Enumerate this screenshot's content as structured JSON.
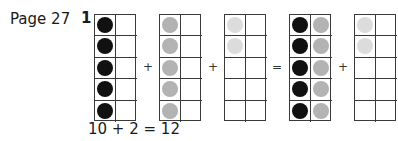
{
  "page_label": "Page 27",
  "question_number": "1",
  "colors": {
    "black": "#111111",
    "grey": "#b3b3b3",
    "light": "#dcdcdc"
  },
  "frames": [
    {
      "left": 94,
      "cells": [
        "black",
        "",
        "black",
        "",
        "black",
        "",
        "black",
        "",
        "black",
        ""
      ]
    },
    {
      "left": 159,
      "cells": [
        "grey",
        "",
        "grey",
        "",
        "grey",
        "",
        "grey",
        "",
        "grey",
        ""
      ]
    },
    {
      "left": 224,
      "cells": [
        "light",
        "",
        "light",
        "",
        "",
        "",
        "",
        "",
        "",
        ""
      ]
    },
    {
      "left": 289,
      "cells": [
        "black",
        "grey",
        "black",
        "grey",
        "black",
        "grey",
        "black",
        "grey",
        "black",
        "grey"
      ]
    },
    {
      "left": 354,
      "cells": [
        "light",
        "",
        "light",
        "",
        "",
        "",
        "",
        "",
        "",
        ""
      ]
    }
  ],
  "operators": [
    {
      "symbol": "+",
      "left": 143
    },
    {
      "symbol": "+",
      "left": 208
    },
    {
      "symbol": "=",
      "left": 272
    },
    {
      "symbol": "+",
      "left": 338
    }
  ],
  "equation": "10 + 2 = 12"
}
